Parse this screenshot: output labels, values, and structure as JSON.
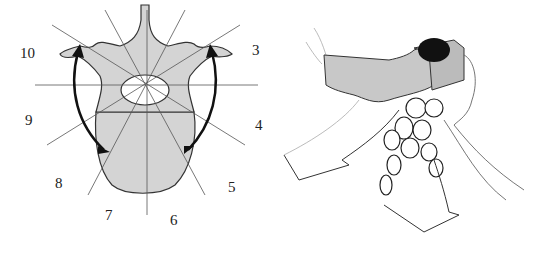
{
  "figure": {
    "left_panel": {
      "description": "Axial vertebra diagram with radial sector lines",
      "sector_labels": [
        "3",
        "4",
        "5",
        "6",
        "7",
        "8",
        "9",
        "10"
      ],
      "arrows": [
        "left-curved-double-arrow",
        "right-curved-double-arrow"
      ]
    },
    "right_panel": {
      "description": "Perspective sketch of vertebral segment with arrows"
    },
    "colors": {
      "bone_fill": "#d4d4d4",
      "line": "#222222",
      "dark_fill": "#111111",
      "background": "#ffffff"
    }
  }
}
